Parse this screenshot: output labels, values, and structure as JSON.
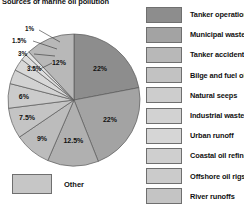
{
  "chart_data": {
    "type": "pie",
    "title": "Sources of marine oil pollution",
    "xlabel": "",
    "ylabel": "",
    "legend_position": "right",
    "grid": false,
    "categories": [
      "Tanker operations",
      "Municipal wastes",
      "Tanker accidents",
      "Bilge and fuel oils",
      "Natural seeps",
      "Industrial waste",
      "Urban runoff",
      "Coastal oil refining",
      "Offshore oil rigs",
      "River runoffs",
      "Other"
    ],
    "values": [
      22,
      22,
      12.5,
      9,
      7.5,
      6,
      3.5,
      3,
      1.5,
      1,
      12
    ],
    "value_labels": [
      "22%",
      "22%",
      "12.5%",
      "9%",
      "7.5%",
      "6%",
      "3.5%",
      "3%",
      "1.5%",
      "1%",
      "12%"
    ],
    "slice_colors": [
      "#8d8d8d",
      "#a3a3a3",
      "#b0b0b0",
      "#bcbcbc",
      "#c4c4c4",
      "#cbcbcb",
      "#d2d2d2",
      "#d8d8d8",
      "#dedede",
      "#e4e4e4",
      "#b8b8b8"
    ]
  },
  "title": "Sources of marine oil pollution",
  "pie": {
    "slices": [
      {
        "label": "22%",
        "value": 22,
        "name": "Tanker operations"
      },
      {
        "label": "22%",
        "value": 22,
        "name": "Municipal wastes"
      },
      {
        "label": "12.5%",
        "value": 12.5,
        "name": "Tanker accidents"
      },
      {
        "label": "9%",
        "value": 9,
        "name": "Bilge and fuel oils"
      },
      {
        "label": "7.5%",
        "value": 7.5,
        "name": "Natural seeps"
      },
      {
        "label": "6%",
        "value": 6,
        "name": "Industrial waste"
      },
      {
        "label": "3.5%",
        "value": 3.5,
        "name": "Urban runoff"
      },
      {
        "label": "3%",
        "value": 3,
        "name": "Coastal oil refining"
      },
      {
        "label": "1.5%",
        "value": 1.5,
        "name": "Offshore oil rigs"
      },
      {
        "label": "1%",
        "value": 1,
        "name": "River runoffs"
      },
      {
        "label": "12%",
        "value": 12,
        "name": "Other"
      }
    ]
  },
  "other_legend": {
    "label": "Other",
    "color": "#c6c6c6"
  },
  "legend": {
    "items": [
      {
        "label": "Tanker operations",
        "color": "#8d8d8d"
      },
      {
        "label": "Municipal wastes",
        "color": "#a3a3a3"
      },
      {
        "label": "Tanker accidents",
        "color": "#b8b8b8"
      },
      {
        "label": "Bilge and fuel oils",
        "color": "#c2c2c2"
      },
      {
        "label": "Natural seeps",
        "color": "#cdcdcd"
      },
      {
        "label": "Industrial waste",
        "color": "#d2d2d2"
      },
      {
        "label": "Urban runoff",
        "color": "#d6d6d6"
      },
      {
        "label": "Coastal oil refining",
        "color": "#cfcfcf"
      },
      {
        "label": "Offshore oil rigs",
        "color": "#cbcbcb"
      },
      {
        "label": "River runoffs",
        "color": "#c4c4c4"
      }
    ]
  }
}
